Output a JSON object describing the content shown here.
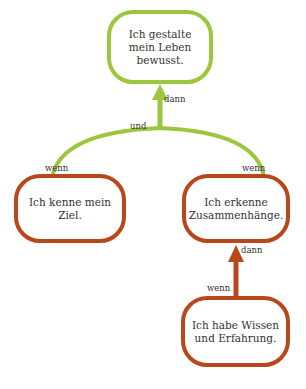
{
  "colors": {
    "goal": "#9cc63b",
    "condition": "#b8481c"
  },
  "nodes": {
    "top": {
      "text": "Ich gestalte mein Leben bewusst."
    },
    "left": {
      "text": "Ich kenne mein Ziel."
    },
    "right": {
      "text": "Ich erkenne Zusammenhänge."
    },
    "bottom": {
      "text": "Ich habe Wissen und Erfahrung."
    }
  },
  "labels": {
    "top_dann": "dann",
    "und": "und",
    "left_wenn": "wenn",
    "right_wenn": "wenn",
    "right_dann": "dann",
    "bottom_wenn": "wenn"
  }
}
